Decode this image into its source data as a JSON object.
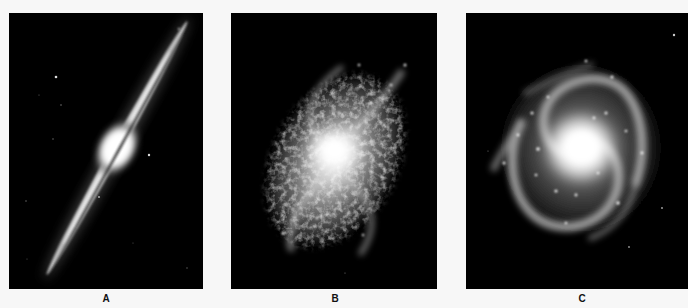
{
  "figure": {
    "panels": [
      {
        "id": "A",
        "label": "A",
        "subject": "edge-on spiral galaxy with central bulge and dust lane"
      },
      {
        "id": "B",
        "label": "B",
        "subject": "flocculent spiral galaxy"
      },
      {
        "id": "C",
        "label": "C",
        "subject": "grand-design spiral galaxy"
      }
    ]
  },
  "colors": {
    "background": "#f7f7f7",
    "panel": "#000000",
    "label": "#111111"
  }
}
